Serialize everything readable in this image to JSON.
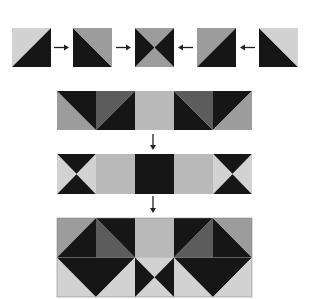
{
  "colors": {
    "light": "#d2d2d2",
    "medium": "#9c9c9c",
    "solid_light": "#b9b9b9",
    "dark": "#5c5c5c",
    "black": "#161616",
    "arrow": "#222222",
    "outline": "#8a8a8a"
  },
  "top_row": {
    "squares": [
      {
        "id": "sq1",
        "x": 12,
        "kind": "half-bl-tr",
        "a": "light",
        "b": "black"
      },
      {
        "id": "sq2",
        "x": 73,
        "kind": "half-tl-br",
        "a": "black",
        "b": "medium"
      },
      {
        "id": "sq3",
        "x": 135,
        "kind": "hourglass-v",
        "a": "black",
        "b": "medium"
      },
      {
        "id": "sq4",
        "x": 197,
        "kind": "half-bl-tr",
        "a": "medium",
        "b": "black"
      },
      {
        "id": "sq5",
        "x": 259,
        "kind": "half-tl-br",
        "a": "black",
        "b": "light"
      }
    ],
    "arrows": [
      {
        "x1": 54,
        "x2": 69,
        "dir": "right"
      },
      {
        "x1": 116,
        "x2": 131,
        "dir": "right"
      },
      {
        "x1": 193,
        "x2": 178,
        "dir": "left"
      },
      {
        "x1": 255,
        "x2": 240,
        "dir": "left"
      }
    ]
  },
  "strip1": {
    "cells": [
      {
        "kind": "half-tl-br",
        "a": "medium",
        "b": "black"
      },
      {
        "kind": "half-bl-tr",
        "a": "dark",
        "b": "black"
      },
      {
        "kind": "solid",
        "a": "solid_light"
      },
      {
        "kind": "half-tl-br",
        "a": "black",
        "b": "dark"
      },
      {
        "kind": "half-bl-tr",
        "a": "black",
        "b": "medium"
      }
    ]
  },
  "strip2": {
    "cells": [
      {
        "kind": "hourglass-h",
        "a": "black",
        "b": "light"
      },
      {
        "kind": "solid",
        "a": "solid_light"
      },
      {
        "kind": "solid",
        "a": "black"
      },
      {
        "kind": "solid",
        "a": "solid_light"
      },
      {
        "kind": "hourglass-h",
        "a": "black",
        "b": "light"
      }
    ]
  },
  "final_block": {
    "rows": [
      [
        {
          "kind": "half-bl-tr",
          "a": "medium",
          "b": "black"
        },
        {
          "kind": "half-tl-br",
          "a": "dark",
          "b": "black"
        },
        {
          "kind": "solid",
          "a": "solid_light"
        },
        {
          "kind": "half-bl-tr",
          "a": "black",
          "b": "dark"
        },
        {
          "kind": "half-tl-br",
          "a": "black",
          "b": "medium"
        }
      ],
      [
        {
          "kind": "half-tl-br",
          "a": "light",
          "b": "black"
        },
        {
          "kind": "half-bl-tr",
          "a": "black",
          "b": "light"
        },
        {
          "kind": "hourglass-v",
          "a": "black",
          "b": "light"
        },
        {
          "kind": "half-tl-br",
          "a": "light",
          "b": "black"
        },
        {
          "kind": "half-bl-tr",
          "a": "black",
          "b": "light"
        }
      ]
    ]
  },
  "down_arrows": [
    {
      "x": 153,
      "y1": 134,
      "y2": 150
    },
    {
      "x": 153,
      "y1": 196,
      "y2": 213
    }
  ]
}
